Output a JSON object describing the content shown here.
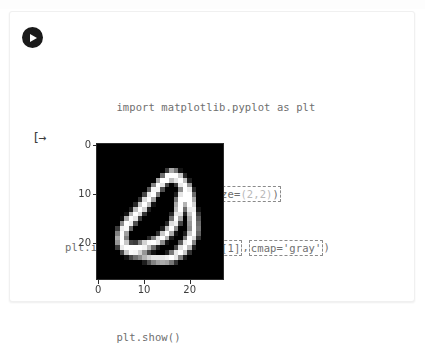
{
  "notebook": {
    "run_button_label": "Run cell",
    "output_marker": "[→",
    "code_lines": [
      {
        "id": "line-import",
        "segments": [
          {
            "text": "import matplotlib.pyplot as plt",
            "highlight": false,
            "dim": false
          }
        ]
      },
      {
        "id": "line-figure",
        "segments": [
          {
            "text": "plt.figure(figsize=",
            "highlight": false,
            "dim": false
          },
          {
            "text": "(2,2)",
            "highlight": false,
            "dim": true
          },
          {
            "text": ")",
            "highlight": false,
            "dim": false
          }
        ],
        "boxed": true,
        "box_text": "plt.figure(figsize=(2,2))"
      },
      {
        "id": "line-imshow",
        "segments": [
          {
            "text": "plt.imshow(",
            "highlight": false,
            "dim": false
          },
          {
            "text": "number_images[1]",
            "highlight": true,
            "dim": false
          },
          {
            "text": ",",
            "highlight": false,
            "dim": false
          },
          {
            "text": "cmap='gray'",
            "highlight": true,
            "dim": false
          },
          {
            "text": ")",
            "highlight": false,
            "dim": false
          }
        ]
      },
      {
        "id": "line-show",
        "segments": [
          {
            "text": "plt.show()",
            "highlight": false,
            "dim": false
          }
        ]
      }
    ],
    "full_code": "import matplotlib.pyplot as plt\n\nplt.figure(figsize=(2,2))\nplt.imshow(number_images[1],cmap='gray')\nplt.show()"
  },
  "code_text": {
    "line1": "import matplotlib.pyplot as plt",
    "line2_a": "plt.figure(figsize=",
    "line2_b": "(2,2)",
    "line2_c": ")",
    "line3_a": "plt.imshow(",
    "line3_b": "number_images[1]",
    "line3_c": ",",
    "line3_d": "cmap='gray'",
    "line3_e": ")",
    "line4": "plt.show()"
  },
  "chart_data": {
    "type": "heatmap",
    "title": "",
    "xlabel": "",
    "ylabel": "",
    "colormap": "gray",
    "figsize": [
      2,
      2
    ],
    "image_shape": [
      28,
      28
    ],
    "value_range": [
      0,
      255
    ],
    "background_color": "#000000",
    "foreground_color": "#ffffff",
    "xlim": [
      -0.5,
      27.5
    ],
    "ylim": [
      27.5,
      -0.5
    ],
    "grid": false,
    "legend": "none",
    "x_ticks": [
      0,
      10,
      20
    ],
    "x_tick_labels": [
      "0",
      "10",
      "20"
    ],
    "y_ticks": [
      0,
      10,
      20
    ],
    "y_tick_labels": [
      "0",
      "10",
      "20"
    ],
    "pixels": [
      [
        0,
        0,
        0,
        0,
        0,
        0,
        0,
        0,
        0,
        0,
        0,
        0,
        0,
        0,
        0,
        0,
        0,
        0,
        0,
        0,
        0,
        0,
        0,
        0,
        0,
        0,
        0,
        0
      ],
      [
        0,
        0,
        0,
        0,
        0,
        0,
        0,
        0,
        0,
        0,
        0,
        0,
        0,
        0,
        0,
        0,
        0,
        0,
        0,
        0,
        0,
        0,
        0,
        0,
        0,
        0,
        0,
        0
      ],
      [
        0,
        0,
        0,
        0,
        0,
        0,
        0,
        0,
        0,
        0,
        0,
        0,
        0,
        0,
        0,
        0,
        0,
        0,
        0,
        0,
        0,
        0,
        0,
        0,
        0,
        0,
        0,
        0
      ],
      [
        0,
        0,
        0,
        0,
        0,
        0,
        0,
        0,
        0,
        0,
        0,
        0,
        0,
        0,
        0,
        0,
        0,
        0,
        0,
        0,
        0,
        0,
        0,
        0,
        0,
        0,
        0,
        0
      ],
      [
        0,
        0,
        0,
        0,
        0,
        0,
        0,
        0,
        0,
        0,
        0,
        0,
        0,
        0,
        0,
        0,
        0,
        0,
        0,
        0,
        0,
        0,
        0,
        0,
        0,
        0,
        0,
        0
      ],
      [
        0,
        0,
        0,
        0,
        0,
        0,
        0,
        0,
        0,
        0,
        0,
        0,
        0,
        0,
        0,
        60,
        170,
        120,
        20,
        0,
        0,
        0,
        0,
        0,
        0,
        0,
        0,
        0
      ],
      [
        0,
        0,
        0,
        0,
        0,
        0,
        0,
        0,
        0,
        0,
        0,
        0,
        0,
        0,
        110,
        255,
        255,
        255,
        200,
        40,
        0,
        0,
        0,
        0,
        0,
        0,
        0,
        0
      ],
      [
        0,
        0,
        0,
        0,
        0,
        0,
        0,
        0,
        0,
        0,
        0,
        0,
        0,
        160,
        255,
        255,
        190,
        230,
        255,
        190,
        30,
        0,
        0,
        0,
        0,
        0,
        0,
        0
      ],
      [
        0,
        0,
        0,
        0,
        0,
        0,
        0,
        0,
        0,
        0,
        0,
        0,
        130,
        255,
        230,
        70,
        0,
        60,
        235,
        255,
        150,
        0,
        0,
        0,
        0,
        0,
        0,
        0
      ],
      [
        0,
        0,
        0,
        0,
        0,
        0,
        0,
        0,
        0,
        0,
        0,
        90,
        245,
        245,
        80,
        0,
        0,
        0,
        140,
        255,
        235,
        40,
        0,
        0,
        0,
        0,
        0,
        0
      ],
      [
        0,
        0,
        0,
        0,
        0,
        0,
        0,
        0,
        0,
        0,
        70,
        235,
        255,
        120,
        0,
        0,
        0,
        30,
        230,
        255,
        255,
        110,
        0,
        0,
        0,
        0,
        0,
        0
      ],
      [
        0,
        0,
        0,
        0,
        0,
        0,
        0,
        0,
        0,
        50,
        220,
        255,
        160,
        0,
        0,
        0,
        0,
        120,
        255,
        255,
        255,
        170,
        0,
        0,
        0,
        0,
        0,
        0
      ],
      [
        0,
        0,
        0,
        0,
        0,
        0,
        0,
        0,
        40,
        200,
        255,
        190,
        20,
        0,
        0,
        0,
        0,
        170,
        255,
        180,
        255,
        210,
        0,
        0,
        0,
        0,
        0,
        0
      ],
      [
        0,
        0,
        0,
        0,
        0,
        0,
        0,
        30,
        190,
        255,
        210,
        30,
        0,
        0,
        0,
        0,
        0,
        190,
        255,
        110,
        235,
        240,
        20,
        0,
        0,
        0,
        0,
        0
      ],
      [
        0,
        0,
        0,
        0,
        0,
        0,
        20,
        180,
        255,
        220,
        50,
        0,
        0,
        0,
        0,
        0,
        40,
        230,
        230,
        40,
        200,
        255,
        60,
        0,
        0,
        0,
        0,
        0
      ],
      [
        0,
        0,
        0,
        0,
        0,
        10,
        170,
        255,
        230,
        60,
        0,
        0,
        0,
        0,
        0,
        0,
        110,
        255,
        170,
        0,
        170,
        255,
        90,
        0,
        0,
        0,
        0,
        0
      ],
      [
        0,
        0,
        0,
        0,
        0,
        140,
        255,
        240,
        80,
        0,
        0,
        0,
        0,
        0,
        0,
        40,
        220,
        240,
        70,
        0,
        150,
        255,
        110,
        0,
        0,
        0,
        0,
        0
      ],
      [
        0,
        0,
        0,
        0,
        60,
        240,
        250,
        100,
        0,
        0,
        0,
        0,
        0,
        0,
        30,
        190,
        255,
        140,
        0,
        0,
        140,
        255,
        120,
        0,
        0,
        0,
        0,
        0
      ],
      [
        0,
        0,
        0,
        0,
        130,
        255,
        160,
        0,
        0,
        0,
        0,
        0,
        0,
        50,
        200,
        255,
        170,
        20,
        0,
        30,
        200,
        255,
        100,
        0,
        0,
        0,
        0,
        0
      ],
      [
        0,
        0,
        0,
        0,
        170,
        255,
        130,
        0,
        0,
        0,
        0,
        40,
        130,
        230,
        255,
        180,
        30,
        0,
        0,
        120,
        255,
        220,
        50,
        0,
        0,
        0,
        0,
        0
      ],
      [
        0,
        0,
        0,
        0,
        150,
        255,
        200,
        70,
        60,
        130,
        210,
        250,
        255,
        230,
        140,
        20,
        0,
        0,
        90,
        235,
        255,
        130,
        0,
        0,
        0,
        0,
        0,
        0
      ],
      [
        0,
        0,
        0,
        0,
        60,
        235,
        255,
        255,
        255,
        255,
        245,
        190,
        110,
        30,
        0,
        0,
        0,
        70,
        225,
        255,
        190,
        30,
        0,
        0,
        0,
        0,
        0,
        0
      ],
      [
        0,
        0,
        0,
        0,
        0,
        70,
        200,
        250,
        245,
        210,
        150,
        70,
        20,
        0,
        0,
        30,
        120,
        230,
        255,
        200,
        50,
        0,
        0,
        0,
        0,
        0,
        0,
        0
      ],
      [
        0,
        0,
        0,
        0,
        0,
        0,
        20,
        70,
        110,
        140,
        180,
        210,
        230,
        230,
        230,
        240,
        255,
        230,
        130,
        30,
        0,
        0,
        0,
        0,
        0,
        0,
        0,
        0
      ],
      [
        0,
        0,
        0,
        0,
        0,
        0,
        0,
        0,
        0,
        0,
        30,
        80,
        130,
        160,
        170,
        160,
        120,
        50,
        0,
        0,
        0,
        0,
        0,
        0,
        0,
        0,
        0,
        0
      ],
      [
        0,
        0,
        0,
        0,
        0,
        0,
        0,
        0,
        0,
        0,
        0,
        0,
        0,
        0,
        0,
        0,
        0,
        0,
        0,
        0,
        0,
        0,
        0,
        0,
        0,
        0,
        0,
        0
      ],
      [
        0,
        0,
        0,
        0,
        0,
        0,
        0,
        0,
        0,
        0,
        0,
        0,
        0,
        0,
        0,
        0,
        0,
        0,
        0,
        0,
        0,
        0,
        0,
        0,
        0,
        0,
        0,
        0
      ],
      [
        0,
        0,
        0,
        0,
        0,
        0,
        0,
        0,
        0,
        0,
        0,
        0,
        0,
        0,
        0,
        0,
        0,
        0,
        0,
        0,
        0,
        0,
        0,
        0,
        0,
        0,
        0,
        0
      ]
    ]
  },
  "colors": {
    "card_background": "#ffffff",
    "card_border": "#f0f0f0",
    "code_text": "#6f6f6f",
    "code_dim": "#b9b9b9",
    "annotation_border": "#8a8a8a",
    "run_button": "#1a1a1a",
    "axes_text": "#3d3d3d",
    "plot_background": "#000000"
  }
}
